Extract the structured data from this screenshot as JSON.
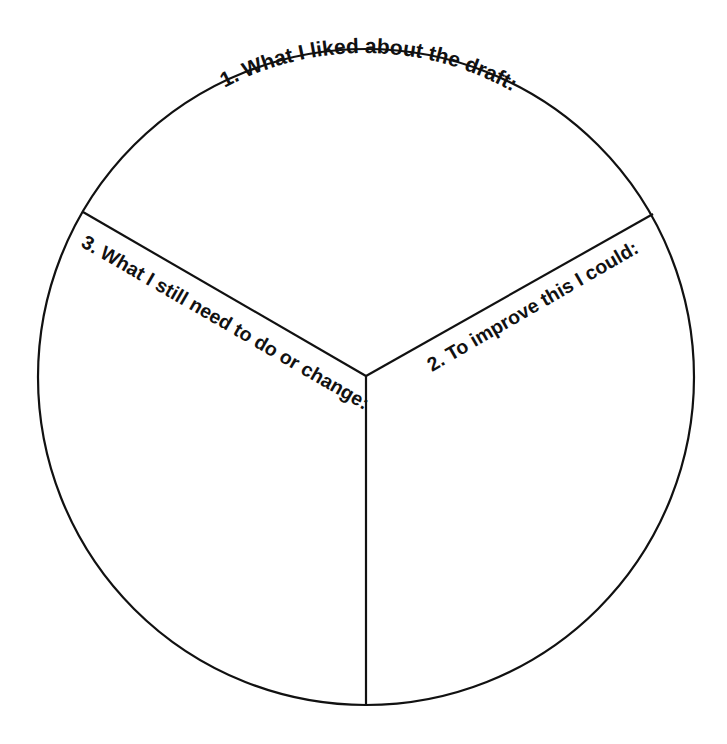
{
  "worksheet": {
    "title": "Draft reflection circle",
    "sections": [
      {
        "id": "section-1",
        "label": "1. What I liked about the draft:"
      },
      {
        "id": "section-2",
        "label": "2. To improve this I could:"
      },
      {
        "id": "section-3",
        "label": "3. What I still need to do or change:"
      }
    ],
    "colors": {
      "line": "#111111",
      "text": "#111111",
      "background": "#ffffff"
    }
  }
}
